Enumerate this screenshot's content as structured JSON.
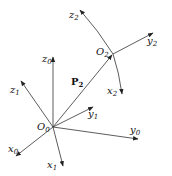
{
  "diagram": {
    "origin0": {
      "label": "O",
      "sub": "0"
    },
    "origin2": {
      "label": "O",
      "sub": "2"
    },
    "vector": {
      "label": "P",
      "sub": "2"
    },
    "frame0": {
      "x": {
        "label": "x",
        "sub": "0"
      },
      "y": {
        "label": "y",
        "sub": "0"
      },
      "z": {
        "label": "z",
        "sub": "0"
      }
    },
    "frame1": {
      "x": {
        "label": "x",
        "sub": "1"
      },
      "y": {
        "label": "y",
        "sub": "1"
      },
      "z": {
        "label": "z",
        "sub": "1"
      }
    },
    "frame2": {
      "x": {
        "label": "x",
        "sub": "2"
      },
      "y": {
        "label": "y",
        "sub": "2"
      },
      "z": {
        "label": "z",
        "sub": "2"
      }
    },
    "line_color": "#333333"
  }
}
